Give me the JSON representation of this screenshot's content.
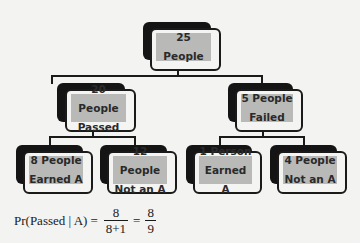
{
  "diagram": {
    "type": "probability tree",
    "root": {
      "line1": "25 People",
      "line2": ""
    },
    "level2": [
      {
        "line1": "20 People",
        "line2": "Passed"
      },
      {
        "line1": "5 People",
        "line2": "Failed"
      }
    ],
    "level3": [
      {
        "line1": "8 People",
        "line2": "Earned A"
      },
      {
        "line1": "12 People",
        "line2": "Not an A"
      },
      {
        "line1": "1 Person",
        "line2": "Earned A"
      },
      {
        "line1": "4 People",
        "line2": "Not an A"
      }
    ]
  },
  "formula": {
    "lhs": "Pr(Passed | A)",
    "eq1": "=",
    "frac1_num": "8",
    "frac1_den": "8+1",
    "eq2": "=",
    "frac2_num": "8",
    "frac2_den": "9"
  },
  "colors": {
    "background": "#f3f3f1",
    "box_fill": "#b9b9b7",
    "box_shadow": "#141414",
    "outline": "#1a1a1a"
  }
}
